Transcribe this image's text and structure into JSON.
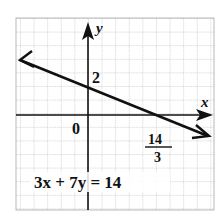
{
  "graph": {
    "equation": "3x + 7y = 14",
    "x_axis_label": "x",
    "y_axis_label": "y",
    "origin_label": "0",
    "y_intercept_label": "2",
    "x_intercept_label": {
      "numerator": "14",
      "denominator": "3"
    },
    "colors": {
      "line": "#111111",
      "grid": "#9a9a9a",
      "axis": "#111111",
      "background": "#ffffff"
    }
  }
}
